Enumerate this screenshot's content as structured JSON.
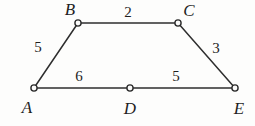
{
  "figure": {
    "background_color": "#fdfdfc",
    "stroke_color": "#2e2e2e",
    "label_color": "#1f1f1f",
    "vertex_fill_color": "#fbfbfa",
    "vertices": [
      {
        "id": "A",
        "label": "A",
        "x": 34,
        "y": 88,
        "label_x": 27,
        "label_y": 107
      },
      {
        "id": "B",
        "label": "B",
        "x": 78,
        "y": 23,
        "label_x": 70,
        "label_y": 9
      },
      {
        "id": "C",
        "label": "C",
        "x": 178,
        "y": 23,
        "label_x": 189,
        "label_y": 10
      },
      {
        "id": "D",
        "label": "D",
        "x": 130,
        "y": 88,
        "label_x": 130,
        "label_y": 108
      },
      {
        "id": "E",
        "label": "E",
        "x": 235,
        "y": 88,
        "label_x": 239,
        "label_y": 108
      }
    ],
    "edges": [
      {
        "id": "AB",
        "from": "A",
        "to": "B",
        "weight": "5",
        "label_x": 38,
        "label_y": 47
      },
      {
        "id": "BC",
        "from": "B",
        "to": "C",
        "weight": "2",
        "label_x": 128,
        "label_y": 12
      },
      {
        "id": "CE",
        "from": "C",
        "to": "E",
        "weight": "3",
        "label_x": 216,
        "label_y": 48
      },
      {
        "id": "AD",
        "from": "A",
        "to": "D",
        "weight": "6",
        "label_x": 79,
        "label_y": 76
      },
      {
        "id": "DE",
        "from": "D",
        "to": "E",
        "weight": "5",
        "label_x": 176,
        "label_y": 76
      }
    ]
  }
}
